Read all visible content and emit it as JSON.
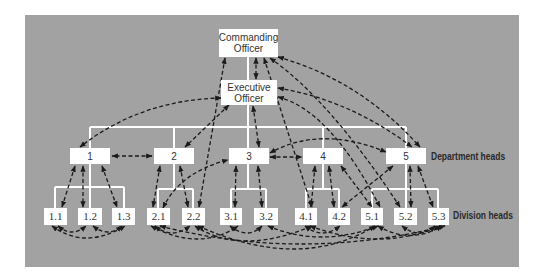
{
  "colors": {
    "background": "#a2a2a2",
    "box": "#ffffff",
    "line": "#ffffff",
    "arrow": "#1a1a1a",
    "page": "#ffffff"
  },
  "nodes": {
    "co": {
      "label_line1": "Commanding",
      "label_line2": "Officer"
    },
    "xo": {
      "label_line1": "Executive",
      "label_line2": "Officer"
    },
    "departments": [
      {
        "id": "d1",
        "label": "1"
      },
      {
        "id": "d2",
        "label": "2"
      },
      {
        "id": "d3",
        "label": "3"
      },
      {
        "id": "d4",
        "label": "4"
      },
      {
        "id": "d5",
        "label": "5"
      }
    ],
    "divisions": [
      {
        "id": "1.1",
        "label": "1.1"
      },
      {
        "id": "1.2",
        "label": "1.2"
      },
      {
        "id": "1.3",
        "label": "1.3"
      },
      {
        "id": "2.1",
        "label": "2.1"
      },
      {
        "id": "2.2",
        "label": "2.2"
      },
      {
        "id": "3.1",
        "label": "3.1"
      },
      {
        "id": "3.2",
        "label": "3.2"
      },
      {
        "id": "4.1",
        "label": "4.1"
      },
      {
        "id": "4.2",
        "label": "4.2"
      },
      {
        "id": "5.1",
        "label": "5.1"
      },
      {
        "id": "5.2",
        "label": "5.2"
      },
      {
        "id": "5.3",
        "label": "5.3"
      }
    ]
  },
  "row_labels": {
    "departments": "Department heads",
    "divisions": "Division heads"
  },
  "legend": {
    "solid_lines": "formal hierarchy",
    "dashed_arrows": "informal communication links"
  }
}
